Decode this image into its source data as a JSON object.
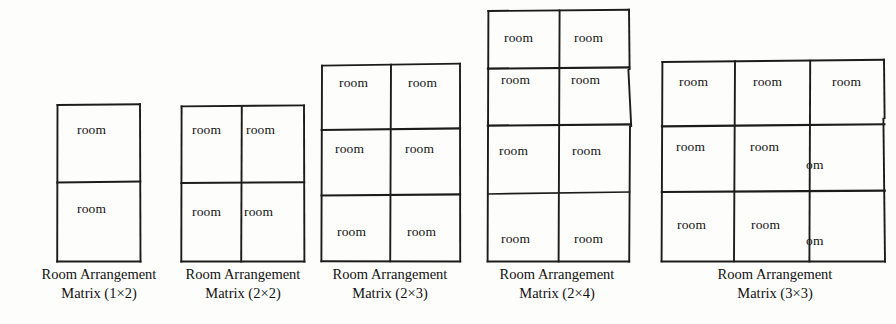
{
  "page": {
    "background_color": "#fdfdfc",
    "ink_color": "#1c1c1c"
  },
  "figures": [
    {
      "id": "matrix-1x2",
      "caption_line1": "Room Arrangement",
      "caption_line2": "Matrix (1×2)",
      "cols": 1,
      "rows": 2,
      "cells": [
        {
          "text": "room"
        },
        {
          "text": "room"
        }
      ]
    },
    {
      "id": "matrix-2x2",
      "caption_line1": "Room Arrangement",
      "caption_line2": "Matrix (2×2)",
      "cols": 2,
      "rows": 2,
      "cells": [
        {
          "text": "room"
        },
        {
          "text": "room"
        },
        {
          "text": "room"
        },
        {
          "text": "room"
        }
      ]
    },
    {
      "id": "matrix-2x3",
      "caption_line1": "Room Arrangement",
      "caption_line2": "Matrix (2×3)",
      "cols": 2,
      "rows": 3,
      "cells": [
        {
          "text": "room"
        },
        {
          "text": "room"
        },
        {
          "text": "room"
        },
        {
          "text": "room"
        },
        {
          "text": "room"
        },
        {
          "text": "room"
        }
      ]
    },
    {
      "id": "matrix-2x4",
      "caption_line1": "Room Arrangement",
      "caption_line2": "Matrix (2×4)",
      "cols": 2,
      "rows": 4,
      "cells": [
        {
          "text": "room"
        },
        {
          "text": "room"
        },
        {
          "text": "room"
        },
        {
          "text": "room"
        },
        {
          "text": "room"
        },
        {
          "text": "room"
        },
        {
          "text": "room"
        },
        {
          "text": "room"
        }
      ]
    },
    {
      "id": "matrix-3x3",
      "caption_line1": "Room Arrangement",
      "caption_line2": "Matrix (3×3)",
      "cols": 3,
      "rows": 3,
      "cells": [
        {
          "text": "room"
        },
        {
          "text": "room"
        },
        {
          "text": "room"
        },
        {
          "text": "room"
        },
        {
          "text": "room"
        },
        {
          "text": "om"
        },
        {
          "text": "room"
        },
        {
          "text": "room"
        },
        {
          "text": "om"
        }
      ]
    }
  ]
}
